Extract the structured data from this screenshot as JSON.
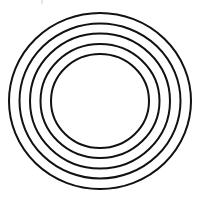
{
  "figure": {
    "type": "concentric-circles",
    "ring_count": 5,
    "stroke_color": "#111111",
    "background_color": "#ffffff",
    "center": [
      100,
      101
    ],
    "rings": [
      {
        "rx": 91,
        "ry": 88
      },
      {
        "rx": 80.5,
        "ry": 77.5
      },
      {
        "rx": 70,
        "ry": 67.5
      },
      {
        "rx": 59.5,
        "ry": 57
      },
      {
        "rx": 49,
        "ry": 47
      }
    ]
  }
}
